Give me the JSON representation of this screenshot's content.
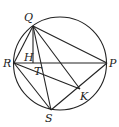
{
  "figure": {
    "type": "geometry",
    "circle": {
      "cx": 60,
      "cy": 63.5,
      "r": 46.5
    },
    "points": {
      "Q": {
        "x": 33,
        "y": 26,
        "label": "Q",
        "lx": 24,
        "ly": 21
      },
      "R": {
        "x": 14,
        "y": 63,
        "label": "R",
        "lx": 3,
        "ly": 67
      },
      "P": {
        "x": 107,
        "y": 63,
        "label": "P",
        "lx": 109,
        "ly": 67
      },
      "S": {
        "x": 51,
        "y": 110,
        "label": "S",
        "lx": 45,
        "ly": 122
      },
      "K": {
        "x": 80,
        "y": 89,
        "label": "K",
        "lx": 80,
        "ly": 100
      },
      "H": {
        "x": 33,
        "y": 63,
        "label": "H",
        "lx": 24,
        "ly": 61
      },
      "T": {
        "x": 40,
        "y": 63,
        "label": "T",
        "lx": 34,
        "ly": 75
      }
    },
    "segments": [
      [
        "Q",
        "R"
      ],
      [
        "Q",
        "P"
      ],
      [
        "Q",
        "H"
      ],
      [
        "Q",
        "S"
      ],
      [
        "Q",
        "K"
      ],
      [
        "R",
        "P"
      ],
      [
        "R",
        "S"
      ],
      [
        "R",
        "K"
      ],
      [
        "S",
        "P"
      ]
    ]
  }
}
